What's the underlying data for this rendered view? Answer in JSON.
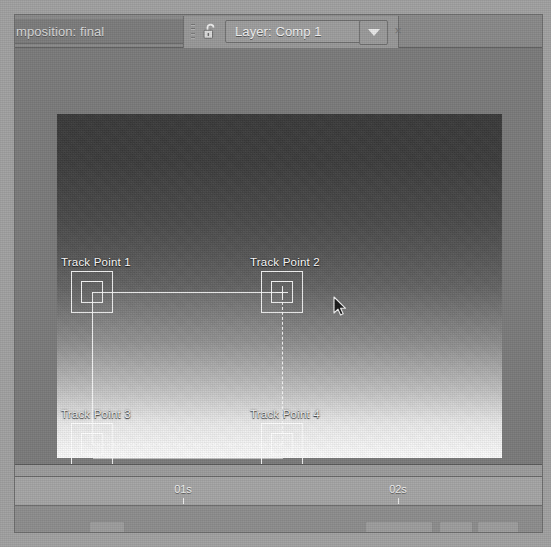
{
  "window": {
    "app_style": "motion-tracking-layer-viewer"
  },
  "tabs": [
    {
      "id": "composition",
      "label": "mposition: final",
      "active": false
    },
    {
      "id": "layer",
      "label": "Layer: Comp 1",
      "active": true,
      "lock_icon": "padlock-open-icon",
      "menu_icon": "chevron-down-icon",
      "close_icon": "close-icon",
      "close_glyph": "×"
    }
  ],
  "viewer": {
    "name": "layer-viewer-canvas",
    "track_points": [
      {
        "id": "tp1",
        "label": "Track Point 1",
        "x": 35,
        "y": 178,
        "label_dx": -31,
        "label_dy": -36,
        "has_crosshair": false,
        "selected": false
      },
      {
        "id": "tp2",
        "label": "Track Point 2",
        "x": 225,
        "y": 178,
        "label_dx": -32,
        "label_dy": -36,
        "has_crosshair": true,
        "selected": true
      },
      {
        "id": "tp3",
        "label": "Track Point 3",
        "x": 35,
        "y": 330,
        "label_dx": -31,
        "label_dy": -36,
        "has_crosshair": false,
        "selected": false
      },
      {
        "id": "tp4",
        "label": "Track Point 4",
        "x": 225,
        "y": 330,
        "label_dx": -32,
        "label_dy": -36,
        "has_crosshair": false,
        "selected": false
      }
    ],
    "cursor": {
      "name": "mouse-pointer",
      "x": 276,
      "y": 182
    }
  },
  "timeline": {
    "name": "timeline-ruler",
    "ticks": [
      {
        "label": "01s",
        "x": 168
      },
      {
        "label": "02s",
        "x": 383
      }
    ]
  },
  "colors": {
    "panel_bg": "#8f8f8f",
    "tab_active_bg": "#9e9e9e",
    "tab_inactive_bg": "#7d7d7d",
    "viewer_bg": "#7c7c7c",
    "overlay_stroke": "#ffffff",
    "ruler_bg": "#a6a6a6",
    "text_light": "#f2f2f2"
  }
}
